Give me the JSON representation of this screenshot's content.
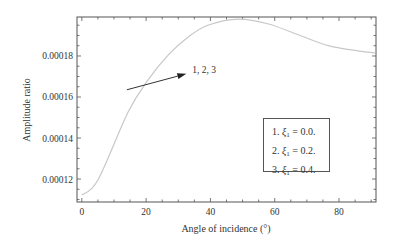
{
  "chart_data": {
    "type": "line",
    "title": "",
    "xlabel": "Angle of incidence (°)",
    "ylabel": "Amplitude ratio",
    "xlim": [
      -1.5,
      91.5
    ],
    "ylim": [
      0.0001088,
      0.000199
    ],
    "xticks": [
      0,
      20,
      40,
      60,
      80
    ],
    "xtick_labels": [
      "0",
      "20",
      "40",
      "60",
      "80"
    ],
    "yticks": [
      0.00012,
      0.00014,
      0.00016,
      0.00018
    ],
    "ytick_labels": [
      "0.00012",
      "0.00014",
      "0.00016",
      "0.00018"
    ],
    "grid": false,
    "legend_position": "lower right (inside)",
    "series": [
      {
        "name": "1, 2, 3 (overlapping: ξ1 = 0.0, 0.2, 0.4)",
        "color": "#c8c8c8",
        "x": [
          0,
          5,
          14.4,
          20.6,
          26.9,
          33.1,
          39.4,
          48.8,
          58.1,
          67.5,
          76.9,
          86.3,
          91.3
        ],
        "y": [
          0.0001122,
          0.0001195,
          0.0001527,
          0.0001683,
          0.0001805,
          0.0001893,
          0.0001951,
          0.000198,
          0.0001956,
          0.0001902,
          0.0001849,
          0.0001824,
          0.0001815
        ]
      }
    ],
    "annotations": [
      {
        "text": "1, 2, 3",
        "arrow_from": [
          14,
          0.0001635
        ],
        "arrow_to": [
          32.5,
          0.0001713
        ]
      }
    ],
    "legend_entries": [
      "1. ξ1 = 0.0.",
      "2. ξ1 = 0.2.",
      "3. ξ1 = 0.4."
    ]
  },
  "legend": {
    "items": [
      {
        "num": "1.",
        "symbol": "ξ",
        "sub": "1",
        "value": "= 0.0."
      },
      {
        "num": "2.",
        "symbol": "ξ",
        "sub": "1",
        "value": "= 0.2."
      },
      {
        "num": "3.",
        "symbol": "ξ",
        "sub": "1",
        "value": "= 0.4."
      }
    ]
  },
  "annotation_label": "1, 2, 3",
  "axes": {
    "xlabel": "Angle of incidence (°)",
    "ylabel": "Amplitude ratio"
  }
}
